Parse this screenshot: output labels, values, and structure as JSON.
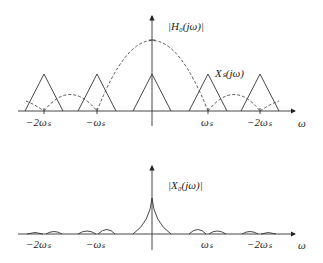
{
  "top": {
    "h0_label": "|H₀(jω)|",
    "xs_label": "Xₛ(jω)",
    "axis_label": "ω",
    "ticks": [
      "−2ωₛ",
      "−ωₛ",
      "ωₛ",
      "−2ωₛ"
    ]
  },
  "bottom": {
    "x0_label": "|X₀(jω)|",
    "axis_label": "ω",
    "ticks": [
      "−2ωₛ",
      "−ωₛ",
      "ωₛ",
      "−2ωₛ"
    ]
  },
  "colors": {
    "line": "#333333",
    "dashed": "#444444"
  }
}
